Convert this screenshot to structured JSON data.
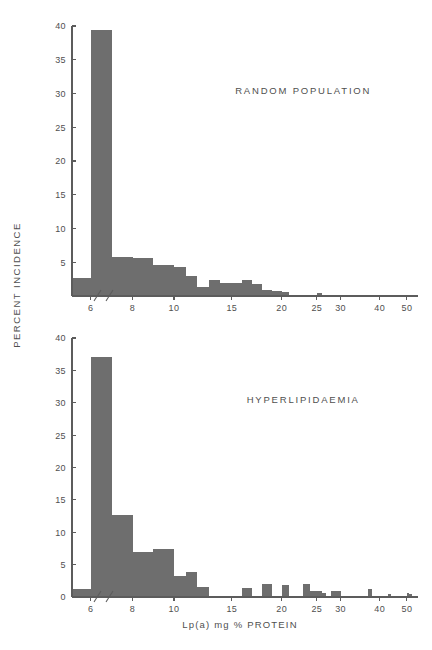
{
  "figure": {
    "ylabel": "PERCENT INCIDENCE",
    "xlabel": "Lp(a)   mg %   PROTEIN",
    "bar_color": "#6e6e6e",
    "axis_color": "#5c5c5c",
    "background": "#ffffff"
  },
  "chart_data": [
    {
      "type": "bar",
      "title": "RANDOM POPULATION",
      "xlabel": "Lp(a)   mg %   PROTEIN",
      "ylabel": "PERCENT INCIDENCE",
      "ylim": [
        0,
        40
      ],
      "yticks": [
        0,
        5,
        10,
        15,
        20,
        25,
        30,
        35,
        40
      ],
      "ytick_labels": [
        "",
        "5",
        "10",
        "15",
        "20",
        "25",
        "30",
        "35",
        "40"
      ],
      "xticks": [
        6,
        8,
        10,
        15,
        20,
        25,
        30,
        40,
        50
      ],
      "xtick_labels": [
        "6",
        "8",
        "10",
        "15",
        "20",
        "25",
        "30",
        "40",
        "50"
      ],
      "xlim": [
        5,
        52
      ],
      "axis_break": true,
      "grid": false,
      "bin_width": 1,
      "bin_starts": [
        5,
        6,
        7,
        8,
        9,
        10,
        11,
        12,
        13,
        14,
        15,
        16,
        17,
        18,
        19,
        20,
        24,
        25
      ],
      "values": [
        2.6,
        39.4,
        5.8,
        5.7,
        4.6,
        4.3,
        2.9,
        1.3,
        2.3,
        1.9,
        1.9,
        2.4,
        1.8,
        0.9,
        0.7,
        0.6,
        0.0,
        0.4
      ]
    },
    {
      "type": "bar",
      "title": "HYPERLIPIDAEMIA",
      "xlabel": "Lp(a)   mg %   PROTEIN",
      "ylabel": "PERCENT INCIDENCE",
      "ylim": [
        0,
        40
      ],
      "yticks": [
        0,
        5,
        10,
        15,
        20,
        25,
        30,
        35,
        40
      ],
      "ytick_labels": [
        "0",
        "5",
        "10",
        "15",
        "20",
        "25",
        "30",
        "35",
        "40"
      ],
      "xticks": [
        6,
        8,
        10,
        15,
        20,
        25,
        30,
        40,
        50
      ],
      "xtick_labels": [
        "6",
        "8",
        "10",
        "15",
        "20",
        "25",
        "30",
        "40",
        "50"
      ],
      "xlim": [
        5,
        52
      ],
      "axis_break": true,
      "grid": false,
      "bin_width": 1,
      "bin_starts": [
        5,
        6,
        7,
        8,
        9,
        10,
        11,
        12,
        13,
        15,
        16,
        17,
        18,
        19,
        20,
        21,
        22,
        23,
        24,
        25,
        26,
        28,
        29,
        30,
        36,
        37,
        40,
        43,
        45,
        49,
        50,
        51
      ],
      "values": [
        1.3,
        37.0,
        12.7,
        6.9,
        7.4,
        3.2,
        3.9,
        1.6,
        0.0,
        0.0,
        1.4,
        0.2,
        2.0,
        0.2,
        1.9,
        0.2,
        0.0,
        2.0,
        1.0,
        0.9,
        0.6,
        0.9,
        0.9,
        0.2,
        0.0,
        1.2,
        0.0,
        0.5,
        0.0,
        0.0,
        0.6,
        0.5
      ]
    }
  ]
}
